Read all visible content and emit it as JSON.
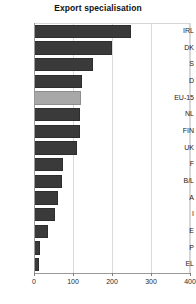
{
  "chart_data": {
    "type": "bar",
    "orientation": "horizontal",
    "title": "Export specialisation",
    "xlabel": "",
    "ylabel": "",
    "xlim": [
      0,
      400
    ],
    "xticks": [
      0,
      100,
      200,
      300,
      400
    ],
    "xtick_labels": [
      "0",
      "100",
      "200",
      "300",
      "400"
    ],
    "grid": true,
    "grid_axis": "x",
    "legend": false,
    "legend_position": "none",
    "categories": [
      "IRL",
      "DK",
      "S",
      "D",
      "EU-15",
      "NL",
      "FIN",
      "UK",
      "F",
      "B/L",
      "A",
      "I",
      "E",
      "P",
      "EL"
    ],
    "values": [
      249,
      200,
      151,
      123,
      120,
      119,
      118,
      110,
      74,
      71,
      62,
      55,
      37,
      16,
      13
    ],
    "bars": [
      {
        "label": "IRL",
        "value": 249,
        "highlight": false
      },
      {
        "label": "DK",
        "value": 200,
        "highlight": false
      },
      {
        "label": "S",
        "value": 151,
        "highlight": false
      },
      {
        "label": "D",
        "value": 123,
        "highlight": false
      },
      {
        "label": "EU-15",
        "value": 120,
        "highlight": true
      },
      {
        "label": "NL",
        "value": 119,
        "highlight": false
      },
      {
        "label": "FIN",
        "value": 118,
        "highlight": false
      },
      {
        "label": "UK",
        "value": 110,
        "highlight": false
      },
      {
        "label": "F",
        "value": 74,
        "highlight": false
      },
      {
        "label": "B/L",
        "value": 71,
        "highlight": false
      },
      {
        "label": "A",
        "value": 62,
        "highlight": false
      },
      {
        "label": "I",
        "value": 55,
        "highlight": false
      },
      {
        "label": "E",
        "value": 37,
        "highlight": false
      },
      {
        "label": "P",
        "value": 16,
        "highlight": false
      },
      {
        "label": "EL",
        "value": 13,
        "highlight": false
      }
    ],
    "colors": {
      "bar": "#3a3a3a",
      "bar_highlight": "#a8a8a8",
      "grid": "#d9d9d9",
      "axis": "#9a9a9a",
      "text": "#1b1b1b",
      "background": "#ffffff"
    }
  }
}
